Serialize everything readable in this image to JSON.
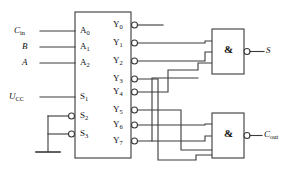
{
  "diagram": {
    "type": "logic-circuit-schematic",
    "stroke_color": "#3a3a3a",
    "text_color": "#111111",
    "background": "#ffffff"
  },
  "decoder": {
    "name": "3-to-8 decoder",
    "address_inputs": [
      {
        "pin": "A",
        "index": "0",
        "signal": "C",
        "signal_sub": "in"
      },
      {
        "pin": "A",
        "index": "1",
        "signal": "B",
        "signal_sub": ""
      },
      {
        "pin": "A",
        "index": "2",
        "signal": "A",
        "signal_sub": ""
      }
    ],
    "enable_inputs": [
      {
        "pin": "S",
        "index": "1",
        "signal": "U",
        "signal_sub": "CC",
        "inverted": false
      },
      {
        "pin": "S",
        "index": "2",
        "signal": "GND",
        "signal_sub": "",
        "inverted": true
      },
      {
        "pin": "S",
        "index": "3",
        "signal": "GND",
        "signal_sub": "",
        "inverted": true
      }
    ],
    "outputs": [
      {
        "pin": "Y",
        "index": "0",
        "inverted": true,
        "connected_to": "none"
      },
      {
        "pin": "Y",
        "index": "1",
        "inverted": true,
        "connected_to": "sum-gate"
      },
      {
        "pin": "Y",
        "index": "2",
        "inverted": true,
        "connected_to": "sum-gate"
      },
      {
        "pin": "Y",
        "index": "3",
        "inverted": true,
        "connected_to": "carry-gate"
      },
      {
        "pin": "Y",
        "index": "4",
        "inverted": true,
        "connected_to": "sum-gate"
      },
      {
        "pin": "Y",
        "index": "5",
        "inverted": true,
        "connected_to": "carry-gate"
      },
      {
        "pin": "Y",
        "index": "6",
        "inverted": true,
        "connected_to": "carry-gate"
      },
      {
        "pin": "Y",
        "index": "7",
        "inverted": true,
        "connected_to": "sum-gate, carry-gate"
      }
    ]
  },
  "gates": [
    {
      "id": "sum-gate",
      "symbol": "&",
      "kind": "NAND",
      "inverted_output": true,
      "inputs": [
        "Y1",
        "Y2",
        "Y4",
        "Y7"
      ],
      "output_signal": "S",
      "output_sub": ""
    },
    {
      "id": "carry-gate",
      "symbol": "&",
      "kind": "NAND",
      "inverted_output": true,
      "inputs": [
        "Y3",
        "Y5",
        "Y6",
        "Y7"
      ],
      "output_signal": "C",
      "output_sub": "out"
    }
  ],
  "ground": {
    "label": "",
    "symbol": "ground-symbol"
  }
}
